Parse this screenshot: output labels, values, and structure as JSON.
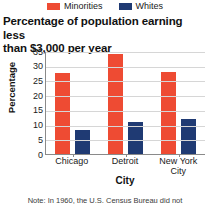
{
  "legend": {
    "position": "top-center",
    "items": [
      {
        "label": "Minorities",
        "color": "#EE4B33",
        "icon": "legend-swatch"
      },
      {
        "label": "Whites",
        "color": "#1F3A73",
        "icon": "legend-swatch"
      }
    ]
  },
  "title_line1": "Percentage of population earning less",
  "title_line2": "than $3,000 per year",
  "note": "Note: In 1960, the U.S. Census Bureau did not",
  "chart_data": {
    "type": "bar",
    "title": "Percentage of population earning less than $3,000 per year",
    "xlabel": "City",
    "ylabel": "Percentage",
    "categories": [
      "Chicago",
      "Detroit",
      "New York City"
    ],
    "category_labels": [
      {
        "line1": "Chicago",
        "line2": ""
      },
      {
        "line1": "Detroit",
        "line2": ""
      },
      {
        "line1": "New York",
        "line2": "City"
      }
    ],
    "series": [
      {
        "name": "Minorities",
        "color": "#EE4B33",
        "values": [
          27.5,
          34,
          28
        ]
      },
      {
        "name": "Whites",
        "color": "#1F3A73",
        "values": [
          8.3,
          11,
          12
        ]
      }
    ],
    "ylim": [
      0,
      35
    ],
    "yticks": [
      35,
      30,
      25,
      20,
      15,
      10,
      5,
      0
    ],
    "grid": true,
    "legend_position": "top"
  }
}
